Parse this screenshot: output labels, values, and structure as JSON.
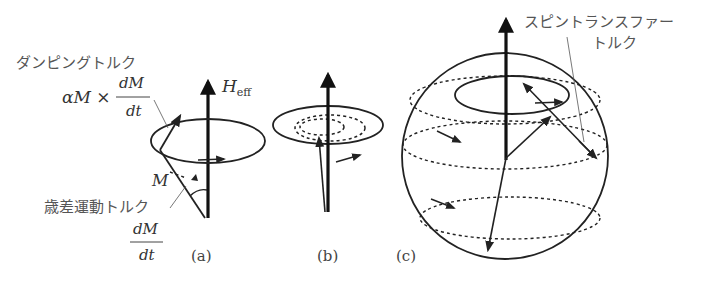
{
  "figure": {
    "panel_a": {
      "label": "(a)",
      "field_label": "H",
      "field_subscript": "eff",
      "damping_torque_label": "ダンピングトルク",
      "damping_expr_left": "αM ×",
      "damping_expr_num": "dM",
      "damping_expr_den": "dt",
      "magnetization_label": "M",
      "precession_torque_label": "歳差運動トルク",
      "precession_expr_num": "dM",
      "precession_expr_den": "dt"
    },
    "panel_b": {
      "label": "(b)"
    },
    "panel_c": {
      "label": "(c)",
      "spin_transfer_label_line1": "スピントランスファー",
      "spin_transfer_label_line2": "トルク"
    }
  },
  "colors": {
    "ink": "#222222",
    "text": "#555555",
    "background": "#ffffff"
  }
}
